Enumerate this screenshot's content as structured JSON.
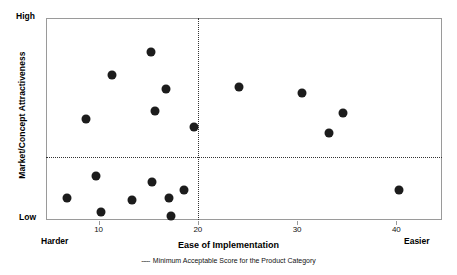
{
  "chart_data": {
    "type": "scatter",
    "title": "",
    "xlabel": "Ease of Implementation",
    "ylabel": "Market/Concept Attractiveness",
    "xlim": [
      4.7,
      44.6
    ],
    "ylim": [
      0,
      100
    ],
    "grid": false,
    "x_ticks": [
      10,
      20,
      30,
      40
    ],
    "x_tick_labels": [
      "10",
      "20",
      "30",
      "40"
    ],
    "y_axis_low_label": "Low",
    "y_axis_high_label": "High",
    "x_axis_left_label": "Harder",
    "x_axis_right_label": "Easier",
    "annotations": {
      "vertical_threshold_x": 20,
      "horizontal_threshold_y": 31,
      "threshold_style": "dotted"
    },
    "legend": {
      "position": "below",
      "entries": [
        {
          "marker": "-----",
          "label": "Minimum Acceptable Score for the Product Category"
        }
      ]
    },
    "points": [
      {
        "x": 15.3,
        "y": 83
      },
      {
        "x": 11.3,
        "y": 72
      },
      {
        "x": 16.8,
        "y": 65
      },
      {
        "x": 15.7,
        "y": 54
      },
      {
        "x": 8.7,
        "y": 50
      },
      {
        "x": 19.6,
        "y": 46
      },
      {
        "x": 24.1,
        "y": 66
      },
      {
        "x": 30.5,
        "y": 63
      },
      {
        "x": 34.6,
        "y": 53
      },
      {
        "x": 33.2,
        "y": 43
      },
      {
        "x": 9.7,
        "y": 22
      },
      {
        "x": 6.8,
        "y": 11
      },
      {
        "x": 10.2,
        "y": 4
      },
      {
        "x": 13.4,
        "y": 10
      },
      {
        "x": 15.4,
        "y": 19
      },
      {
        "x": 17.1,
        "y": 11
      },
      {
        "x": 18.6,
        "y": 15
      },
      {
        "x": 17.3,
        "y": 2
      },
      {
        "x": 40.3,
        "y": 15
      }
    ]
  }
}
